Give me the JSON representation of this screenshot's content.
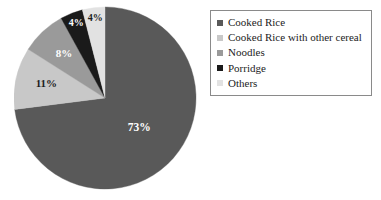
{
  "chart_data": {
    "type": "pie",
    "title": "",
    "categories": [
      "Cooked Rice",
      "Cooked Rice with other cereal",
      "Noodles",
      "Porridge",
      "Others"
    ],
    "values": [
      73,
      11,
      8,
      4,
      4
    ],
    "value_labels": [
      "73%",
      "11%",
      "8%",
      "4%",
      "4%"
    ],
    "units": "percent",
    "total": 100,
    "start_angle_deg": 0,
    "direction": "clockwise",
    "colors": [
      "#595959",
      "#c8c8c8",
      "#9a9a9a",
      "#1a1a1a",
      "#e2e2e2"
    ],
    "label_colors": [
      "#ffffff",
      "#1c1c1c",
      "#ffffff",
      "#ffffff",
      "#1c1c1c"
    ],
    "legend": {
      "position": "right",
      "border": true,
      "border_color": "#8a8a8a",
      "entries": [
        {
          "label": "Cooked Rice",
          "color": "#595959"
        },
        {
          "label": "Cooked Rice with other cereal",
          "color": "#c8c8c8"
        },
        {
          "label": "Noodles",
          "color": "#9a9a9a"
        },
        {
          "label": "Porridge",
          "color": "#1a1a1a"
        },
        {
          "label": "Others",
          "color": "#e2e2e2"
        }
      ]
    },
    "grid": false,
    "xlabel": "",
    "ylabel": ""
  },
  "labels": {
    "slice_0": "73%",
    "slice_1": "11%",
    "slice_2": "8%",
    "slice_3": "4%",
    "slice_4": "4%"
  }
}
